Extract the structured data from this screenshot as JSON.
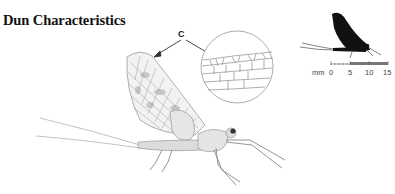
{
  "title": "Dun Characteristics",
  "callout": {
    "label": "C"
  },
  "scale_bar": {
    "unit": "mm",
    "ticks": [
      "0",
      "5",
      "10",
      "15"
    ]
  },
  "colors": {
    "silhouette": "#111111",
    "line_art": "#555555",
    "scale_fill": "#777777",
    "background": "#ffffff"
  }
}
